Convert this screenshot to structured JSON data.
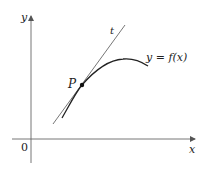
{
  "diagram": {
    "type": "tangent-line-to-curve",
    "labels": {
      "y_axis": "y",
      "x_axis": "x",
      "origin": "0",
      "tangent": "t",
      "curve": "y = f(x)",
      "point": "P"
    },
    "colors": {
      "axes": "#555555",
      "tangent": "#666666",
      "curve": "#222222",
      "point": "#111111"
    }
  }
}
